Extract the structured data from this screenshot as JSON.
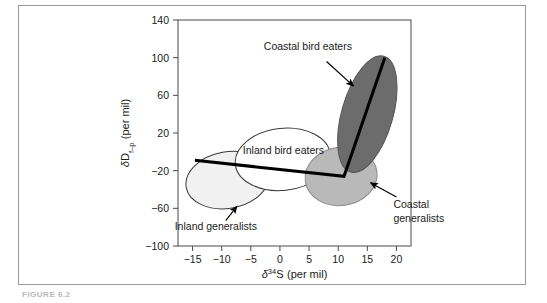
{
  "figure": {
    "caption": "FIGURE 6.2",
    "frame": {
      "border_color": "#9a9a9a"
    }
  },
  "chart_data": {
    "type": "scatter",
    "title": "",
    "xlabel": "δ³⁴S (per mil)",
    "ylabel": "δDf–ₚ (per mil)",
    "xlabel_parts": {
      "delta": "δ",
      "sup": "34",
      "element": "S",
      "units": "(per mil)"
    },
    "ylabel_parts": {
      "delta": "δ",
      "element": "D",
      "sub": "f–p",
      "units": "(per mil)"
    },
    "xlim": [
      -17.5,
      22.5
    ],
    "ylim": [
      -100,
      140
    ],
    "xticks": [
      -15,
      -10,
      -5,
      0,
      5,
      10,
      15,
      20
    ],
    "xticklabels": [
      "−15",
      "−10",
      "−5",
      "0",
      "5",
      "10",
      "15",
      "20"
    ],
    "yticks": [
      -100,
      -60,
      -20,
      20,
      60,
      100,
      140
    ],
    "yticklabels": [
      "−100",
      "−60",
      "−20",
      "20",
      "60",
      "100",
      "140"
    ],
    "grid": false,
    "legend_position": "none",
    "ellipses": [
      {
        "name": "Inland generalists",
        "cx": -9.0,
        "cy": -30.0,
        "rx": 7.2,
        "ry": 30.0,
        "rotation": -10,
        "fill": "#f1f1f1",
        "stroke": "#3a3a3a",
        "opacity": 1.0
      },
      {
        "name": "Inland bird eaters",
        "cx": 0.5,
        "cy": -8.0,
        "rx": 8.2,
        "ry": 33.0,
        "rotation": -6,
        "fill": "#ffffff",
        "stroke": "#3a3a3a",
        "opacity": 1.0
      },
      {
        "name": "Coastal generalists",
        "cx": 10.5,
        "cy": -26.0,
        "rx": 6.2,
        "ry": 31.0,
        "rotation": -8,
        "fill": "#b9b9b9",
        "stroke": "#8a8a8a",
        "opacity": 1.0
      },
      {
        "name": "Coastal bird eaters",
        "cx": 15.0,
        "cy": 40.0,
        "rx": 4.4,
        "ry": 64.0,
        "rotation": 16,
        "fill": "#6c6c6c",
        "stroke": "#555555",
        "opacity": 1.0
      }
    ],
    "trend_line": {
      "name": "mixing-line",
      "color": "#000000",
      "width": 3,
      "points": [
        {
          "x": -14.6,
          "y": -9.0
        },
        {
          "x": 11.0,
          "y": -26.0
        },
        {
          "x": 18.0,
          "y": 100.0
        }
      ]
    },
    "annotations": [
      {
        "id": "coastal-bird-eaters",
        "text": "Coastal bird eaters",
        "text_x": 4.8,
        "text_y": 108.0,
        "anchor": "middle",
        "arrow_from_x": 8.0,
        "arrow_from_y": 96.0,
        "arrow_to_x": 12.6,
        "arrow_to_y": 70.0
      },
      {
        "id": "inland-bird-eaters",
        "text": "Inland bird eaters",
        "text_x": 0.6,
        "text_y": -2.0,
        "anchor": "middle",
        "arrow_from_x": null,
        "arrow_from_y": null,
        "arrow_to_x": null,
        "arrow_to_y": null
      },
      {
        "id": "inland-generalists",
        "text": "Inland generalists",
        "text_x": -11.0,
        "text_y": -83.0,
        "anchor": "middle",
        "arrow_from_x": -9.3,
        "arrow_from_y": -73.0,
        "arrow_to_x": -7.4,
        "arrow_to_y": -58.0
      }
    ],
    "outside_annotations": [
      {
        "id": "coastal-generalists",
        "line1": "Coastal",
        "line2": "generalists",
        "arrow_from_x": 20.0,
        "arrow_from_y": -48.0,
        "arrow_to_x": 15.6,
        "arrow_to_y": -33.0
      }
    ]
  }
}
